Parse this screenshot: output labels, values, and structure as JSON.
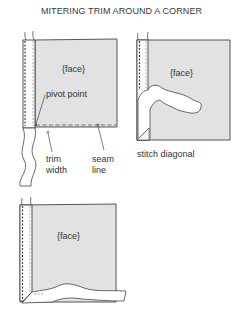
{
  "title": "MITERING TRIM AROUND A CORNER",
  "colors": {
    "face_fill": "#e2e2e2",
    "trim_fill": "#ffffff",
    "outline": "#444444",
    "text": "#333333"
  },
  "panels": [
    {
      "id": "step1",
      "face_label": "{face}",
      "callouts": [
        {
          "label": "pivot point"
        },
        {
          "label_line1": "trim",
          "label_line2": "width"
        },
        {
          "label_line1": "seam",
          "label_line2": "line"
        }
      ]
    },
    {
      "id": "step2",
      "face_label": "{face}",
      "caption": "stitch diagonal"
    },
    {
      "id": "step3",
      "face_label": "{face}"
    }
  ]
}
